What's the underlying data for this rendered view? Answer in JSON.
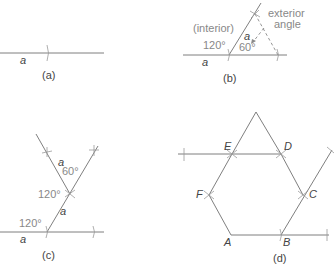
{
  "panels": {
    "a": {
      "caption": "(a)",
      "side_label": "a"
    },
    "b": {
      "caption": "(b)",
      "side_label_base": "a",
      "side_label_slant": "a",
      "interior_label": "(interior)",
      "interior_angle": "120°",
      "exterior_angle_value": "60°",
      "exterior_label_line1": "exterior",
      "exterior_label_line2": "angle"
    },
    "c": {
      "caption": "(c)",
      "side_label_base": "a",
      "side_label_lower": "a",
      "side_label_upper": "a",
      "angle_lower": "120°",
      "angle_middle": "120°",
      "angle_upper": "60°"
    },
    "d": {
      "caption": "(d)",
      "vertices": [
        "A",
        "B",
        "C",
        "D",
        "E",
        "F"
      ]
    }
  },
  "colors": {
    "line": "#707070",
    "text": "#666666",
    "background": "#ffffff"
  }
}
